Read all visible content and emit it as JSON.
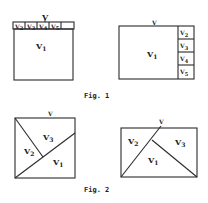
{
  "figures": [
    {
      "caption": "Fig. 1",
      "panels": [
        {
          "id": "fig1-left",
          "top_label": "V",
          "main_label": "V",
          "main_sub": "1",
          "cells": [
            {
              "label": "V",
              "sub": "2"
            },
            {
              "label": "V",
              "sub": "3"
            },
            {
              "label": "V",
              "sub": "4"
            },
            {
              "label": "V",
              "sub": "5"
            }
          ]
        },
        {
          "id": "fig1-right",
          "top_label": "V",
          "main_label": "V",
          "main_sub": "1",
          "cells": [
            {
              "label": "V",
              "sub": "2"
            },
            {
              "label": "V",
              "sub": "3"
            },
            {
              "label": "V",
              "sub": "4"
            },
            {
              "label": "V",
              "sub": "5"
            }
          ]
        }
      ]
    },
    {
      "caption": "Fig. 2",
      "panels": [
        {
          "id": "fig2-left",
          "top_label": "V",
          "regions": [
            {
              "label": "V",
              "sub": "1"
            },
            {
              "label": "V",
              "sub": "2"
            },
            {
              "label": "V",
              "sub": "3"
            }
          ]
        },
        {
          "id": "fig2-right",
          "top_label": "V",
          "regions": [
            {
              "label": "V",
              "sub": "1"
            },
            {
              "label": "V",
              "sub": "2"
            },
            {
              "label": "V",
              "sub": "3"
            }
          ]
        }
      ]
    }
  ]
}
